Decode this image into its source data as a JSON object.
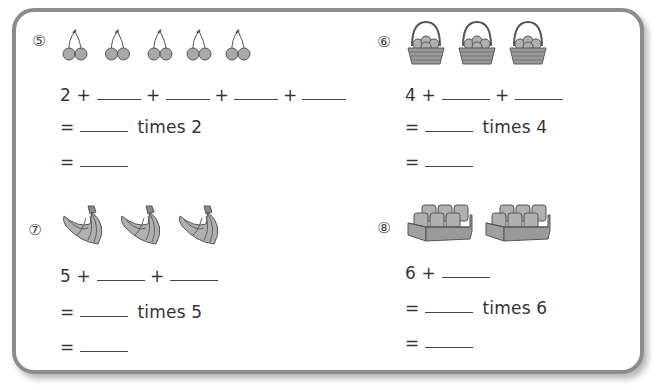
{
  "problems": [
    {
      "number": "⑤",
      "item": "cherries",
      "count": 5,
      "line1": {
        "start": "2 +",
        "blanks": 4,
        "plus": "+"
      },
      "line2": {
        "eq": "=",
        "times_label": "times 2"
      },
      "line3": {
        "eq": "="
      }
    },
    {
      "number": "⑥",
      "item": "basket of apples",
      "count": 3,
      "line1": {
        "start": "4 +",
        "blanks": 2,
        "plus": "+"
      },
      "line2": {
        "eq": "=",
        "times_label": "times 4"
      },
      "line3": {
        "eq": "="
      }
    },
    {
      "number": "⑦",
      "item": "bunch of bananas",
      "count": 3,
      "line1": {
        "start": "5 +",
        "blanks": 2,
        "plus": "+"
      },
      "line2": {
        "eq": "=",
        "times_label": "times 5"
      },
      "line3": {
        "eq": "="
      }
    },
    {
      "number": "⑧",
      "item": "pack of cans",
      "count": 2,
      "line1": {
        "start": "6 +",
        "blanks": 1,
        "plus": "+"
      },
      "line2": {
        "eq": "=",
        "times_label": "times 6"
      },
      "line3": {
        "eq": "="
      }
    }
  ],
  "colors": {
    "frame": "#8c8c8c",
    "icon_fill": "#a8a8a8",
    "icon_stroke": "#555555"
  }
}
